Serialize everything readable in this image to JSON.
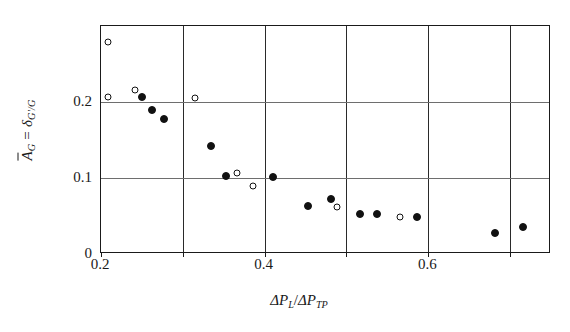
{
  "chart_data": {
    "type": "scatter",
    "title": "",
    "xlabel": "ΔP_L/ΔP_TP",
    "ylabel": "Ā_G = δ_G'/G",
    "xlim": [
      0.2,
      0.75
    ],
    "ylim": [
      0,
      0.3
    ],
    "grid": true,
    "legend_position": "none",
    "xticks": [
      {
        "value": 0.2,
        "label": "0.2"
      },
      {
        "value": 0.4,
        "label": "0.4"
      },
      {
        "value": 0.6,
        "label": "0.6"
      }
    ],
    "yticks": [
      {
        "value": 0,
        "label": "0"
      },
      {
        "value": 0.1,
        "label": "0.1"
      },
      {
        "value": 0.2,
        "label": "0.2"
      }
    ],
    "xgridlines": [
      0.2,
      0.3,
      0.4,
      0.5,
      0.6,
      0.7,
      0.75
    ],
    "ygridlines": [
      0.1,
      0.2
    ],
    "series": [
      {
        "name": "filled-circles",
        "marker": "filled-circle",
        "color": "#111111",
        "points": [
          {
            "x": 0.25,
            "y": 0.206
          },
          {
            "x": 0.262,
            "y": 0.19
          },
          {
            "x": 0.277,
            "y": 0.178
          },
          {
            "x": 0.334,
            "y": 0.142
          },
          {
            "x": 0.353,
            "y": 0.102
          },
          {
            "x": 0.41,
            "y": 0.101
          },
          {
            "x": 0.453,
            "y": 0.063
          },
          {
            "x": 0.481,
            "y": 0.073
          },
          {
            "x": 0.516,
            "y": 0.052
          },
          {
            "x": 0.537,
            "y": 0.052
          },
          {
            "x": 0.586,
            "y": 0.049
          },
          {
            "x": 0.681,
            "y": 0.028
          },
          {
            "x": 0.716,
            "y": 0.036
          }
        ]
      },
      {
        "name": "open-circles",
        "marker": "open-circle",
        "color": "#111111",
        "points": [
          {
            "x": 0.209,
            "y": 0.279
          },
          {
            "x": 0.208,
            "y": 0.206
          },
          {
            "x": 0.242,
            "y": 0.216
          },
          {
            "x": 0.315,
            "y": 0.205
          },
          {
            "x": 0.366,
            "y": 0.106
          },
          {
            "x": 0.386,
            "y": 0.09
          },
          {
            "x": 0.489,
            "y": 0.062
          },
          {
            "x": 0.566,
            "y": 0.049
          }
        ]
      }
    ]
  },
  "axis_label_parts": {
    "y_abar": "A",
    "y_abar_sub": "G",
    "y_eq": " = ",
    "y_delta": "δ",
    "y_delta_sub": "G'/G",
    "x_delta1": "ΔP",
    "x_sub1": "L",
    "x_slash": "/",
    "x_delta2": "ΔP",
    "x_sub2": "TP"
  }
}
